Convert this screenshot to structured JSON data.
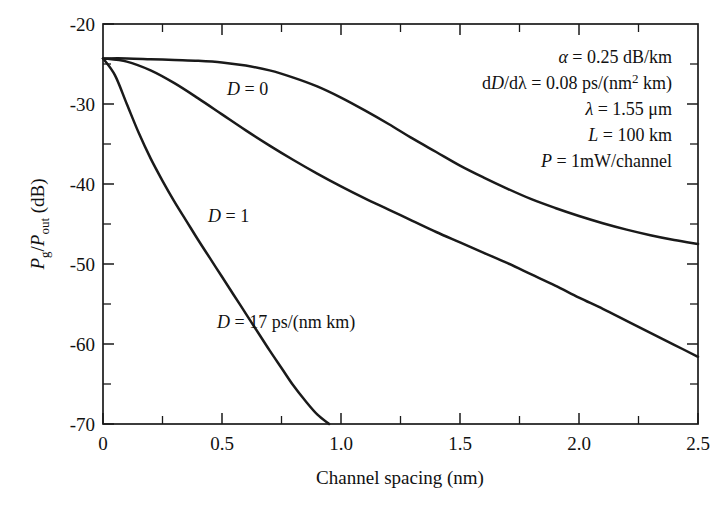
{
  "chart_data": {
    "type": "line",
    "title": "",
    "xlabel": "Channel spacing (nm)",
    "ylabel": "Pg/Pout (dB)",
    "xlim": [
      0,
      2.5
    ],
    "ylim": [
      -70,
      -20
    ],
    "grid": false,
    "legend_position": "inline-curve-labels",
    "x_ticks": [
      "0",
      "0.5",
      "1.0",
      "1.5",
      "2.0",
      "2.5"
    ],
    "x_tick_values": [
      0,
      0.5,
      1.0,
      1.5,
      2.0,
      2.5
    ],
    "x_minor_step": 0.25,
    "y_ticks": [
      "-20",
      "-30",
      "-40",
      "-50",
      "-60",
      "-70"
    ],
    "y_tick_values": [
      -20,
      -30,
      -40,
      -50,
      -60,
      -70
    ],
    "y_minor_step": 5,
    "series": [
      {
        "name": "D = 0",
        "label": "D = 0",
        "x": [
          0.0,
          0.1,
          0.2,
          0.3,
          0.4,
          0.5,
          0.6,
          0.7,
          0.8,
          0.9,
          1.0,
          1.1,
          1.2,
          1.3,
          1.4,
          1.5,
          1.6,
          1.7,
          1.8,
          1.9,
          2.0,
          2.1,
          2.2,
          2.3,
          2.4,
          2.5
        ],
        "y": [
          -24.3,
          -24.3,
          -24.4,
          -24.5,
          -24.6,
          -24.8,
          -25.2,
          -25.8,
          -26.7,
          -27.8,
          -29.2,
          -30.8,
          -32.5,
          -34.3,
          -36.0,
          -37.7,
          -39.2,
          -40.6,
          -41.9,
          -43.0,
          -44.0,
          -44.9,
          -45.7,
          -46.4,
          -47.0,
          -47.5
        ]
      },
      {
        "name": "D = 1",
        "label": "D = 1",
        "x": [
          0.0,
          0.1,
          0.2,
          0.3,
          0.4,
          0.5,
          0.6,
          0.7,
          0.8,
          0.9,
          1.0,
          1.1,
          1.2,
          1.3,
          1.4,
          1.5,
          1.6,
          1.7,
          1.8,
          1.9,
          2.0,
          2.1,
          2.2,
          2.3,
          2.4,
          2.5
        ],
        "y": [
          -24.3,
          -24.7,
          -25.8,
          -27.4,
          -29.3,
          -31.3,
          -33.3,
          -35.2,
          -37.0,
          -38.7,
          -40.3,
          -41.8,
          -43.2,
          -44.6,
          -46.0,
          -47.3,
          -48.6,
          -49.9,
          -51.3,
          -52.7,
          -54.2,
          -55.6,
          -57.1,
          -58.6,
          -60.1,
          -61.6
        ]
      },
      {
        "name": "D = 17 ps/(nm km)",
        "label": "D = 17 ps/(nm km)",
        "x": [
          0.0,
          0.05,
          0.1,
          0.15,
          0.2,
          0.25,
          0.3,
          0.35,
          0.4,
          0.45,
          0.5,
          0.55,
          0.6,
          0.65,
          0.7,
          0.75,
          0.8,
          0.85,
          0.9,
          0.95
        ],
        "y": [
          -24.3,
          -26.4,
          -30.0,
          -33.6,
          -36.8,
          -39.6,
          -42.2,
          -44.6,
          -47.0,
          -49.3,
          -51.6,
          -53.9,
          -56.2,
          -58.5,
          -60.8,
          -63.0,
          -65.2,
          -67.1,
          -68.8,
          -70.0
        ]
      }
    ],
    "curve_labels": [
      {
        "text": "D = 0",
        "x_pos": 0.52,
        "y_pos": -27.5
      },
      {
        "text": "D = 1",
        "x_pos": 0.44,
        "y_pos": -43.3
      },
      {
        "text": "D = 17 ps/(nm km)",
        "x_pos": 0.48,
        "y_pos": -56.6
      }
    ],
    "annotations": {
      "lines": [
        {
          "symbol": "α",
          "relation": "=",
          "value": "0.25 dB/km"
        },
        {
          "symbol": "dD/dλ",
          "relation": "=",
          "value": "0.08 ps/(nm² km)"
        },
        {
          "symbol": "λ",
          "relation": "=",
          "value": "1.55 μm"
        },
        {
          "symbol": "L",
          "relation": "=",
          "value": "100 km"
        },
        {
          "symbol": "P",
          "relation": "=",
          "value": "1mW/channel"
        }
      ],
      "alpha_symbol": "α",
      "alpha_value": "0.25 dB/km",
      "slope_d_prefix": "d",
      "slope_d_italic": "D",
      "slope_dlambda": "/dλ",
      "slope_value_pre": "0.08 ps/(nm",
      "slope_value_sup": "2",
      "slope_value_post": " km)",
      "lambda_symbol": "λ",
      "lambda_value": "1.55 μm",
      "length_symbol": "L",
      "length_value": "100 km",
      "power_symbol": "P",
      "power_value": "1mW/channel",
      "equals": "="
    },
    "ylabel_parts": {
      "p1": "P",
      "sub1": "g",
      "slash": "/",
      "p2": "P",
      "sub2": "out",
      "unit": " (dB)"
    },
    "colors": {
      "curve": "#1a1a1a",
      "axis": "#1a1a1a",
      "background": "#ffffff",
      "text": "#111111"
    }
  }
}
